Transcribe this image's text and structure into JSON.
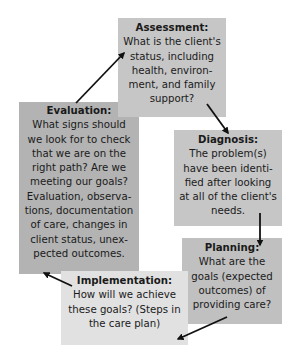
{
  "diagram": {
    "type": "cycle",
    "nodes": [
      {
        "id": "assessment",
        "title": "Assessment:",
        "body": "What is the client's\nstatus, including\nhealth, environ-\nment, and family\nsupport?"
      },
      {
        "id": "diagnosis",
        "title": "Diagnosis:",
        "body": "The problem(s)\nhave been identi-\nfied after looking\nat all of the client's\nneeds."
      },
      {
        "id": "planning",
        "title": "Planning:",
        "body": "What are the\ngoals (expected\noutcomes) of\nproviding care?"
      },
      {
        "id": "implementation",
        "title": "Implementation:",
        "body": "How will we achieve\nthese goals? (Steps in\nthe care plan)"
      },
      {
        "id": "evaluation",
        "title": "Evaluation:",
        "body": "What signs should\nwe look for to check\nthat we are on the\nright path? Are we\nmeeting our goals?\nEvaluation, observa-\ntions, documentation\nof care, changes in\nclient status, unex-\npected outcomes."
      }
    ],
    "edges": [
      {
        "from": "assessment",
        "to": "diagnosis"
      },
      {
        "from": "diagnosis",
        "to": "planning"
      },
      {
        "from": "planning",
        "to": "implementation"
      },
      {
        "from": "implementation",
        "to": "evaluation"
      },
      {
        "from": "evaluation",
        "to": "assessment"
      }
    ]
  }
}
